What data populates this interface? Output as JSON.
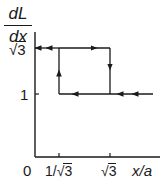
{
  "figure": {
    "y_axis_label": {
      "numerator": "dL",
      "denominator": "dx"
    },
    "x_axis_label": "x/a",
    "origin_label": "0",
    "y_ticks": [
      {
        "label_prefix": "",
        "label_radicand": "3",
        "is_sqrt": true,
        "value": "√3"
      },
      {
        "label_prefix": "",
        "label_radicand": "",
        "is_sqrt": false,
        "value": "1"
      }
    ],
    "x_ticks": [
      {
        "label_prefix": "1/",
        "label_radicand": "3",
        "value": "1/√3"
      },
      {
        "label_prefix": "",
        "label_radicand": "3",
        "value": "√3"
      }
    ],
    "line_color": "#1a1a1a"
  },
  "labels": {
    "ytick_sqrt3_root": "√",
    "ytick_sqrt3_rad": "3",
    "ytick_1": "1",
    "origin": "0",
    "xtick_inv_prefix": "1/",
    "xtick_inv_root": "√",
    "xtick_inv_rad": "3",
    "xtick_sqrt3_root": "√",
    "xtick_sqrt3_rad": "3",
    "xlabel": "x/a",
    "ylabel_num": "dL",
    "ylabel_den": "dx"
  }
}
